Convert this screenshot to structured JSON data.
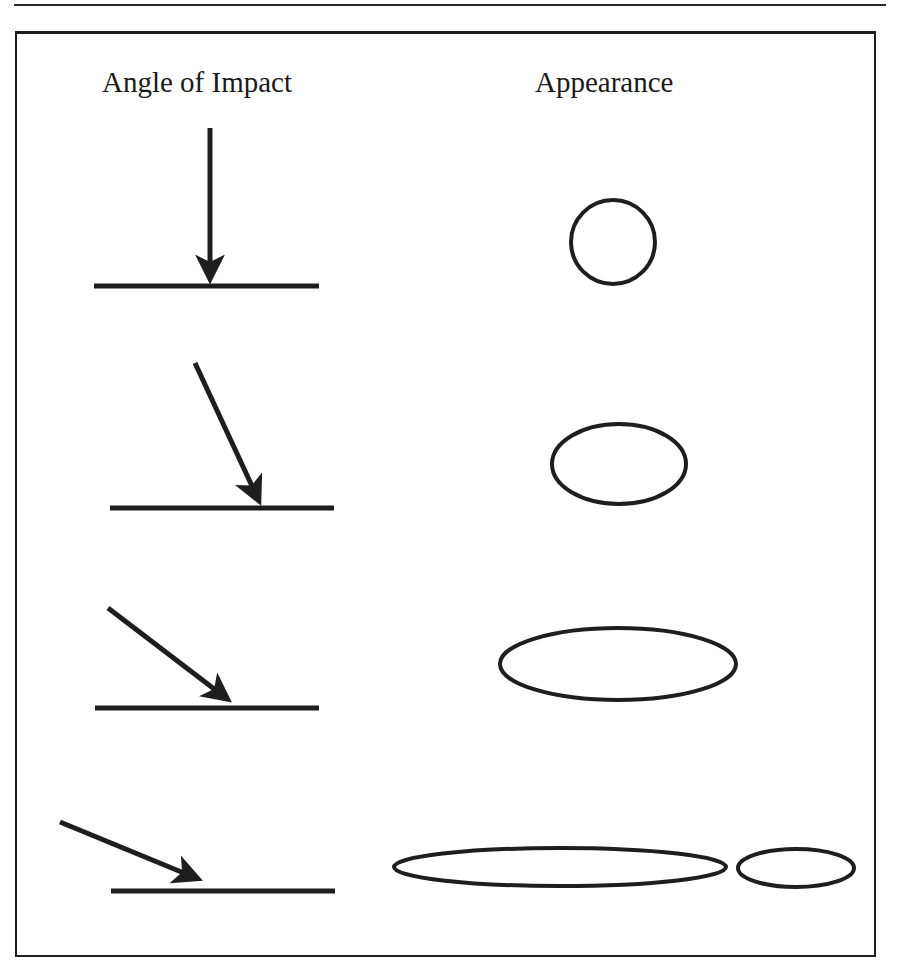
{
  "headings": {
    "left": "Angle of Impact",
    "right": "Appearance"
  },
  "colors": {
    "ink": "#1e1e1e",
    "background": "#ffffff"
  },
  "rows": [
    {
      "impact_angle": "90° (perpendicular)",
      "arrow": {
        "x1": 210,
        "y1": 128,
        "x2": 210,
        "y2": 277
      },
      "surface": {
        "x1": 94,
        "y1": 286,
        "x2": 319,
        "y2": 286
      },
      "shapes": [
        {
          "type": "circle",
          "cx": 613,
          "cy": 242,
          "rx": 42,
          "ry": 42
        }
      ]
    },
    {
      "impact_angle": "steep oblique",
      "arrow": {
        "x1": 195,
        "y1": 363,
        "x2": 258,
        "y2": 499
      },
      "surface": {
        "x1": 110,
        "y1": 508,
        "x2": 334,
        "y2": 508
      },
      "shapes": [
        {
          "type": "ellipse",
          "cx": 619,
          "cy": 464,
          "rx": 67,
          "ry": 40
        }
      ]
    },
    {
      "impact_angle": "moderate oblique",
      "arrow": {
        "x1": 108,
        "y1": 608,
        "x2": 226,
        "y2": 698
      },
      "surface": {
        "x1": 95,
        "y1": 708,
        "x2": 319,
        "y2": 708
      },
      "shapes": [
        {
          "type": "ellipse",
          "cx": 618,
          "cy": 664,
          "rx": 118,
          "ry": 36
        }
      ]
    },
    {
      "impact_angle": "shallow oblique",
      "arrow": {
        "x1": 60,
        "y1": 822,
        "x2": 196,
        "y2": 878
      },
      "surface": {
        "x1": 111,
        "y1": 891,
        "x2": 335,
        "y2": 891
      },
      "shapes": [
        {
          "type": "ellipse",
          "cx": 560,
          "cy": 867,
          "rx": 166,
          "ry": 19
        },
        {
          "type": "ellipse",
          "cx": 796,
          "cy": 868,
          "rx": 58,
          "ry": 19
        }
      ]
    }
  ]
}
